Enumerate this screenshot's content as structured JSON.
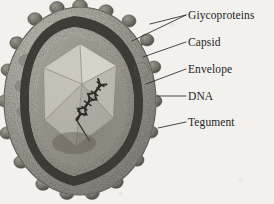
{
  "figure": {
    "background_color": "#f2f1ee",
    "ink_color": "#262422",
    "rendering": "grayscale scanned textbook illustration"
  },
  "labels": [
    {
      "id": "glycoproteins",
      "text": "Giycoproteins",
      "x": 188,
      "y": 9,
      "leaders": 2
    },
    {
      "id": "capsid",
      "text": "Capsid",
      "x": 188,
      "y": 36,
      "leaders": 1
    },
    {
      "id": "envelope",
      "text": "Envelope",
      "x": 188,
      "y": 63,
      "leaders": 1
    },
    {
      "id": "dna",
      "text": "DNA",
      "x": 188,
      "y": 90,
      "leaders": 1
    },
    {
      "id": "tegument",
      "text": "Tegument",
      "x": 188,
      "y": 116,
      "leaders": 1
    }
  ],
  "structures": {
    "virion": {
      "center_x": 80,
      "center_y": 101,
      "radius_x": 76,
      "radius_y": 94
    },
    "envelope_ring": {
      "color": "#3a3833",
      "description": "dark lipid bilayer band beneath spike layer"
    },
    "tegument": {
      "color": "#b5b2aa",
      "description": "granular layer between envelope and capsid"
    },
    "capsid": {
      "shape": "icosahedron",
      "color": "#cfccc3",
      "facets": 6
    },
    "genome": {
      "type": "double-stranded DNA",
      "form": "double helix",
      "color": "#2e2c28"
    },
    "glycoprotein_spikes": {
      "count": 34,
      "shape": "knobbed stalk",
      "color": "#6f6c64"
    }
  },
  "watermark": {
    "symbol": "©",
    "x": 142,
    "y": 70
  }
}
